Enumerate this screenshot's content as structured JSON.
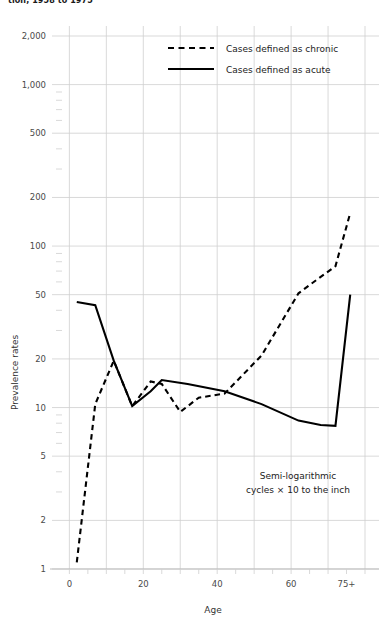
{
  "title": "tion, 1958 to 1975",
  "chart_data": {
    "type": "line",
    "title": "tion, 1958 to 1975",
    "xlabel": "Age",
    "ylabel": "Prevalence rates",
    "yscale": "log",
    "ylim": [
      1,
      2000
    ],
    "xlim": [
      -2,
      80
    ],
    "grid": true,
    "legend_position": "top-center",
    "yticks": [
      1,
      2,
      5,
      10,
      20,
      50,
      100,
      200,
      500,
      1000,
      2000
    ],
    "ytick_labels": [
      "1",
      "2",
      "5",
      "10",
      "20",
      "50",
      "100",
      "200",
      "500",
      "1,000",
      "2,000"
    ],
    "xticks": [
      0,
      20,
      40,
      60,
      75
    ],
    "xtick_labels": [
      "0",
      "20",
      "40",
      "60",
      "75+"
    ],
    "annotation_line1": "Semi-logarithmic",
    "annotation_line2": "cycles × 10 to the inch",
    "series": [
      {
        "name": "Cases defined as chronic",
        "style": "dashed",
        "color": "#000000",
        "x": [
          2,
          7,
          12,
          17,
          22,
          25,
          30,
          35,
          42,
          52,
          62,
          67,
          72,
          76
        ],
        "values": [
          1.1,
          10.5,
          19.5,
          10.2,
          14.5,
          14.0,
          9.4,
          11.5,
          12.2,
          21.0,
          51.0,
          62.0,
          75.0,
          160.0
        ]
      },
      {
        "name": "Cases defined as acute",
        "style": "solid",
        "color": "#000000",
        "x": [
          2,
          7,
          12,
          17,
          22,
          25,
          32,
          42,
          52,
          62,
          68,
          72,
          76
        ],
        "values": [
          45.0,
          43.0,
          19.5,
          10.2,
          12.6,
          14.8,
          14.0,
          12.6,
          10.5,
          8.3,
          7.8,
          7.7,
          50.0
        ]
      }
    ]
  },
  "legend": [
    {
      "label": "Cases defined as chronic",
      "style": "dashed"
    },
    {
      "label": "Cases defined as acute",
      "style": "solid"
    }
  ]
}
